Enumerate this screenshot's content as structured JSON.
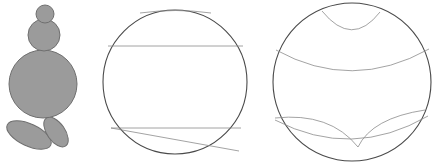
{
  "panel": {
    "width": 432,
    "height": 164,
    "background": "#ffffff",
    "caption": ""
  },
  "style": {
    "fill_gray": "#9b9b9b",
    "outline_dark": "#6f6f6f",
    "stroke_outer": "#4a4a4a",
    "stroke_inner": "#8c8c8c",
    "stroke_width_outer": 1.1,
    "stroke_width_inner": 0.8
  },
  "figures": [
    {
      "id": "figure-1",
      "name": "filled-blob-figure",
      "label": "",
      "description": "Stacked filled circles with two leaf shapes",
      "parts": [
        {
          "name": "small-top-circle",
          "cx": 45,
          "cy": 14,
          "r": 9
        },
        {
          "name": "medium-circle",
          "cx": 44,
          "cy": 35,
          "r": 16
        },
        {
          "name": "large-circle",
          "cx": 43,
          "cy": 84,
          "r": 34
        },
        {
          "name": "left-leaf",
          "tip_x": 10,
          "tip_y": 152,
          "base_x": 43,
          "base_y": 118
        },
        {
          "name": "right-leaf",
          "tip_x": 70,
          "tip_y": 145,
          "base_x": 43,
          "base_y": 118
        }
      ]
    },
    {
      "id": "figure-2",
      "name": "circle-with-chords-figure",
      "label": "",
      "description": "Circle cut by straight chords",
      "circle": {
        "cx": 175,
        "cy": 82,
        "r": 72
      },
      "chords": [
        {
          "name": "top-shallow-chord",
          "x1": 142,
          "y1": 12,
          "x2": 210,
          "y2": 12,
          "curved": true
        },
        {
          "name": "upper-horizontal-chord",
          "x1": 108,
          "y1": 46,
          "x2": 243,
          "y2": 46
        },
        {
          "name": "lower-horizontal-chord",
          "x1": 111,
          "y1": 128,
          "x2": 241,
          "y2": 128
        },
        {
          "name": "diagonal-chord",
          "x1": 111,
          "y1": 128,
          "x2": 239,
          "y2": 151
        }
      ]
    },
    {
      "id": "figure-3",
      "name": "circle-with-arcs-figure",
      "label": "",
      "description": "Circle cut by curved hyperbolic arcs",
      "circle": {
        "cx": 352,
        "cy": 82,
        "r": 79
      },
      "arcs": [
        {
          "name": "top-lens-arc",
          "x1": 324,
          "y1": 12,
          "x2": 378,
          "y2": 13,
          "sag": 20
        },
        {
          "name": "upper-wide-arc",
          "x1": 277,
          "y1": 52,
          "x2": 428,
          "y2": 51,
          "sag": 26
        },
        {
          "name": "lower-left-arc",
          "x1": 276,
          "y1": 118,
          "x2": 358,
          "y2": 146,
          "sag": 24
        },
        {
          "name": "lower-right-arc",
          "x1": 358,
          "y1": 146,
          "x2": 424,
          "y2": 112,
          "sag": 18
        },
        {
          "name": "lower-sweep-arc",
          "x1": 276,
          "y1": 121,
          "x2": 427,
          "y2": 118,
          "sag": 30
        }
      ]
    }
  ]
}
